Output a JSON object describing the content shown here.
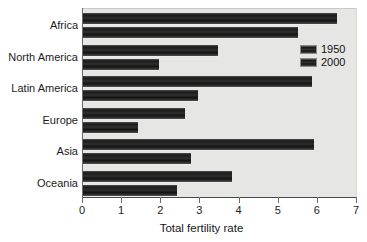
{
  "chart_data": {
    "type": "bar",
    "orientation": "horizontal",
    "title": "",
    "xlabel": "Total fertility rate",
    "ylabel": "",
    "xlim": [
      0,
      7
    ],
    "xticks": [
      0,
      1,
      2,
      3,
      4,
      5,
      6,
      7
    ],
    "xtick_labels": [
      "0",
      "1",
      "2",
      "3",
      "4",
      "5",
      "6",
      "7"
    ],
    "grid": false,
    "legend_position": "upper right",
    "categories": [
      "Africa",
      "North America",
      "Latin America",
      "Europe",
      "Asia",
      "Oceania"
    ],
    "series": [
      {
        "name": "1950",
        "values": [
          6.5,
          3.45,
          5.85,
          2.6,
          5.9,
          3.8
        ],
        "color": "#262626"
      },
      {
        "name": "2000",
        "values": [
          5.5,
          1.95,
          2.95,
          1.4,
          2.75,
          2.4
        ],
        "color": "#262626"
      }
    ]
  },
  "axis": {
    "x_title": "Total fertility rate"
  },
  "legend": {
    "entries": [
      {
        "label": "1950"
      },
      {
        "label": "2000"
      }
    ]
  },
  "colors": {
    "plot_background": "#e6e6e4",
    "page_background": "#ffffff",
    "bar_dark": "#1a1a1a",
    "axis_line": "#4a4a4a",
    "text": "#1c1c1c"
  }
}
